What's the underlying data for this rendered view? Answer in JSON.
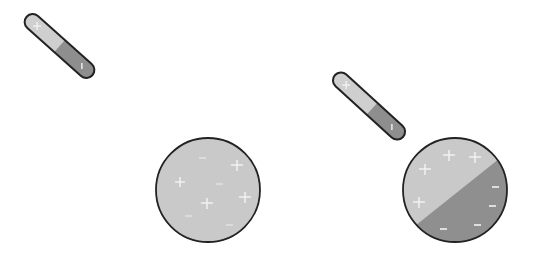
{
  "diagram": {
    "colors": {
      "background": "#ffffff",
      "outline": "#222222",
      "light_fill": "#c9c9c9",
      "dark_fill": "#8f8f8f",
      "charge_mark": "#f2f2f2"
    },
    "panels": [
      {
        "id": "before",
        "rod": {
          "positive_end": "+",
          "negative_end": "−"
        },
        "sphere": {
          "state": "uniform charge distribution",
          "plus_count": 4,
          "minus_count": 5
        }
      },
      {
        "id": "after",
        "rod": {
          "positive_end": "+",
          "negative_end": "−"
        },
        "sphere": {
          "state": "polarized",
          "plus_count": 4,
          "minus_count": 4
        }
      }
    ]
  }
}
